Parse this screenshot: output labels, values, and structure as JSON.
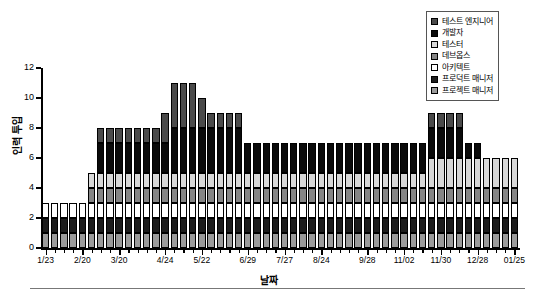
{
  "chart_data": {
    "type": "bar",
    "title": "",
    "xlabel": "날짜",
    "ylabel": "인력 투입",
    "ylim": [
      0,
      12
    ],
    "yticks": [
      0,
      2,
      4,
      6,
      8,
      10,
      12
    ],
    "grid": false,
    "stacked": true,
    "legend_position": "top-right",
    "categories": [
      "1/23",
      "1/30",
      "2/06",
      "2/13",
      "2/20",
      "2/27",
      "3/06",
      "3/13",
      "3/20",
      "3/27",
      "4/03",
      "4/10",
      "4/17",
      "4/24",
      "5/01",
      "5/08",
      "5/15",
      "5/22",
      "5/29",
      "6/05",
      "6/12",
      "6/19",
      "6/29",
      "7/06",
      "7/13",
      "7/20",
      "7/27",
      "8/03",
      "8/10",
      "8/17",
      "8/24",
      "8/31",
      "9/07",
      "9/14",
      "9/21",
      "9/28",
      "10/05",
      "10/12",
      "10/19",
      "11/02",
      "11/09",
      "11/16",
      "11/23",
      "11/30",
      "12/07",
      "12/14",
      "12/21",
      "12/28",
      "01/04",
      "01/11",
      "01/18",
      "01/25"
    ],
    "tick_labels": [
      "1/23",
      "2/20",
      "3/20",
      "4/24",
      "5/22",
      "6/29",
      "7/27",
      "8/24",
      "9/28",
      "11/02",
      "11/30",
      "12/28",
      "01/25"
    ],
    "tick_label_indices": [
      0,
      4,
      8,
      13,
      17,
      22,
      26,
      30,
      35,
      39,
      43,
      47,
      51
    ],
    "series": [
      {
        "name": "프로젝트 매니저",
        "color": "#9a9a9a",
        "values": [
          1,
          1,
          1,
          1,
          1,
          1,
          1,
          1,
          1,
          1,
          1,
          1,
          1,
          1,
          1,
          1,
          1,
          1,
          1,
          1,
          1,
          1,
          1,
          1,
          1,
          1,
          1,
          1,
          1,
          1,
          1,
          1,
          1,
          1,
          1,
          1,
          1,
          1,
          1,
          1,
          1,
          1,
          1,
          1,
          1,
          1,
          1,
          1,
          1,
          1,
          1,
          1
        ]
      },
      {
        "name": "프로덕트 매니저",
        "color": "#1c1c1c",
        "values": [
          1,
          1,
          1,
          1,
          1,
          1,
          1,
          1,
          1,
          1,
          1,
          1,
          1,
          1,
          1,
          1,
          1,
          1,
          1,
          1,
          1,
          1,
          1,
          1,
          1,
          1,
          1,
          1,
          1,
          1,
          1,
          1,
          1,
          1,
          1,
          1,
          1,
          1,
          1,
          1,
          1,
          1,
          1,
          1,
          1,
          1,
          1,
          1,
          1,
          1,
          1,
          1
        ]
      },
      {
        "name": "아키텍트",
        "color": "#ffffff",
        "values": [
          1,
          1,
          1,
          1,
          1,
          1,
          1,
          1,
          1,
          1,
          1,
          1,
          1,
          1,
          1,
          1,
          1,
          1,
          1,
          1,
          1,
          1,
          1,
          1,
          1,
          1,
          1,
          1,
          1,
          1,
          1,
          1,
          1,
          1,
          1,
          1,
          1,
          1,
          1,
          1,
          1,
          1,
          1,
          1,
          1,
          1,
          1,
          1,
          1,
          1,
          1,
          1
        ]
      },
      {
        "name": "데브옵스",
        "color": "#858585",
        "values": [
          0,
          0,
          0,
          0,
          0,
          1,
          1,
          1,
          1,
          1,
          1,
          1,
          1,
          1,
          1,
          1,
          1,
          1,
          1,
          1,
          1,
          1,
          1,
          1,
          1,
          1,
          1,
          1,
          1,
          1,
          1,
          1,
          1,
          1,
          1,
          1,
          1,
          1,
          1,
          1,
          1,
          1,
          1,
          1,
          1,
          1,
          1,
          1,
          1,
          1,
          1,
          1
        ]
      },
      {
        "name": "테스터",
        "color": "#d8d8d8",
        "values": [
          0,
          0,
          0,
          0,
          0,
          1,
          1,
          1,
          1,
          1,
          1,
          1,
          1,
          1,
          1,
          1,
          1,
          1,
          1,
          1,
          1,
          1,
          1,
          1,
          1,
          1,
          1,
          1,
          1,
          1,
          1,
          1,
          1,
          1,
          1,
          1,
          1,
          1,
          1,
          1,
          1,
          1,
          2,
          2,
          2,
          2,
          2,
          2,
          2,
          2,
          2,
          2
        ]
      },
      {
        "name": "개발자",
        "color": "#0a0a0a",
        "values": [
          0,
          0,
          0,
          0,
          0,
          0,
          2,
          2,
          2,
          2,
          2,
          2,
          2,
          2,
          3,
          3,
          3,
          3,
          3,
          3,
          3,
          3,
          2,
          2,
          2,
          2,
          2,
          2,
          2,
          2,
          2,
          2,
          2,
          2,
          2,
          2,
          2,
          2,
          2,
          2,
          2,
          2,
          2,
          2,
          2,
          2,
          1,
          1,
          0,
          0,
          0,
          0
        ]
      },
      {
        "name": "테스트 엔지니어",
        "color": "#4a4a4a",
        "values": [
          0,
          0,
          0,
          0,
          0,
          0,
          1,
          1,
          1,
          1,
          1,
          1,
          1,
          2,
          3,
          3,
          3,
          2,
          1,
          1,
          1,
          1,
          0,
          0,
          0,
          0,
          0,
          0,
          0,
          0,
          0,
          0,
          0,
          0,
          0,
          0,
          0,
          0,
          0,
          0,
          0,
          0,
          1,
          1,
          1,
          1,
          0,
          0,
          0,
          0,
          0,
          0
        ]
      }
    ],
    "totals": [
      3,
      3,
      3,
      3,
      3,
      5,
      8,
      8,
      8,
      8,
      8,
      8,
      8,
      9,
      10,
      10,
      10,
      9,
      8,
      8,
      8,
      8,
      7,
      7,
      7,
      7,
      7,
      7,
      7,
      7,
      7,
      7,
      7,
      7,
      7,
      7,
      7,
      7,
      7,
      7,
      7,
      7,
      8,
      8,
      8,
      8,
      7,
      7,
      6,
      6,
      6,
      6
    ]
  },
  "legend": {
    "items": [
      {
        "label": "테스트 엔지니어",
        "color": "#4a4a4a"
      },
      {
        "label": "개발자",
        "color": "#0a0a0a"
      },
      {
        "label": "테스터",
        "color": "#d8d8d8"
      },
      {
        "label": "데브옵스",
        "color": "#858585"
      },
      {
        "label": "아키텍트",
        "color": "#ffffff"
      },
      {
        "label": "프로덕트 매니저",
        "color": "#1c1c1c"
      },
      {
        "label": "프로젝트 매니저",
        "color": "#9a9a9a"
      }
    ]
  }
}
